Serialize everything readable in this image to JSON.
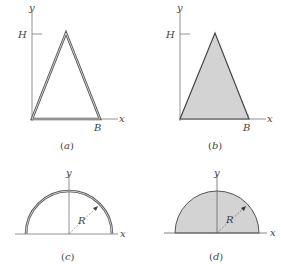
{
  "colors": {
    "background": "#ffffff",
    "axis": "#777777",
    "outline": "#444444",
    "fill": "#d3d3d3",
    "label": "#444444"
  },
  "figures": [
    {
      "id": "a",
      "caption": "a",
      "shape": "thin-walled triangle",
      "labels": {
        "y_axis": "y",
        "x_axis": "x",
        "height": "H",
        "base": "B"
      }
    },
    {
      "id": "b",
      "caption": "b",
      "shape": "solid triangle",
      "labels": {
        "y_axis": "y",
        "x_axis": "x",
        "height": "H",
        "base": "B"
      }
    },
    {
      "id": "c",
      "caption": "c",
      "shape": "thin-walled semicircle",
      "labels": {
        "y_axis": "y",
        "x_axis": "x",
        "radius": "R"
      }
    },
    {
      "id": "d",
      "caption": "d",
      "shape": "solid semicircle",
      "labels": {
        "y_axis": "y",
        "x_axis": "x",
        "radius": "R"
      }
    }
  ]
}
